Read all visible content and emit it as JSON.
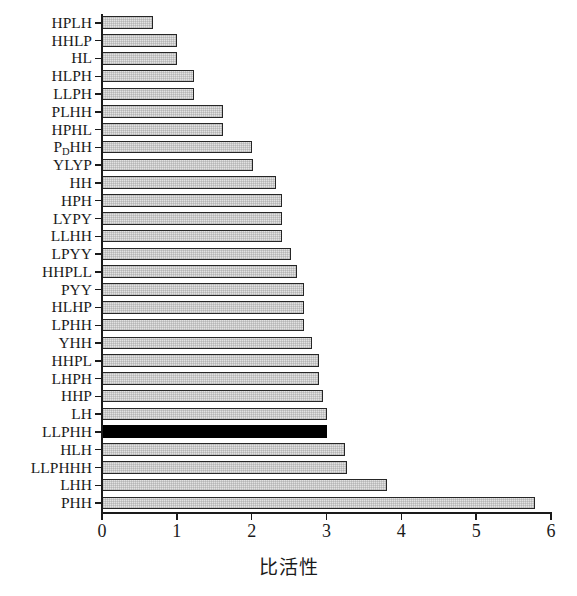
{
  "chart_data": {
    "type": "bar",
    "orientation": "horizontal",
    "title": "",
    "subtitle": "",
    "xlabel": "比活性",
    "ylabel": "",
    "xlim": [
      0,
      6
    ],
    "ylim": [],
    "grid": false,
    "legend": null,
    "xticks": [
      "0",
      "1",
      "2",
      "3",
      "4",
      "5",
      "6"
    ],
    "xtick_values": [
      0,
      1,
      2,
      3,
      4,
      5,
      6
    ],
    "categories": [
      "HPLH",
      "HHLP",
      "HL",
      "HLPH",
      "LLPH",
      "PLHH",
      "HPHL",
      "PDHH",
      "YLYP",
      "HH",
      "HPH",
      "LYPY",
      "LLHH",
      "LPYY",
      "HHPLL",
      "PYY",
      "HLHP",
      "LPHH",
      "YHH",
      "HHPL",
      "LHPH",
      "HHP",
      "LH",
      "LLPHH",
      "HLH",
      "LLPHHH",
      "LHH",
      "PHH"
    ],
    "category_labels_html": [
      "HPLH",
      "HHLP",
      "HL",
      "HLPH",
      "LLPH",
      "PLHH",
      "HPHL",
      "P<sub>D</sub>HH",
      "YLYP",
      "HH",
      "HPH",
      "LYPY",
      "LLHH",
      "LPYY",
      "HHPLL",
      "PYY",
      "HLHP",
      "LPHH",
      "YHH",
      "HHPL",
      "LHPH",
      "HHP",
      "LH",
      "LLPHH",
      "HLH",
      "LLPHHH",
      "LHH",
      "PHH"
    ],
    "values": [
      0.68,
      1.0,
      1.0,
      1.23,
      1.23,
      1.62,
      1.62,
      2.0,
      2.02,
      2.32,
      2.4,
      2.4,
      2.4,
      2.52,
      2.6,
      2.7,
      2.7,
      2.7,
      2.8,
      2.9,
      2.9,
      2.95,
      3.0,
      3.0,
      3.25,
      3.28,
      3.81,
      5.79
    ],
    "highlight_index": 23,
    "highlight_category": "LLPHH",
    "colors": {
      "bar_fill": "#e2e2e2",
      "bar_edge": "#262626",
      "highlight_fill": "#000000",
      "axis": "#1a1a1a",
      "background": "#ffffff"
    }
  }
}
